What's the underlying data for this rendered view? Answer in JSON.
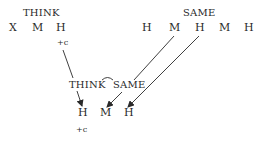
{
  "diagram": {
    "top_left": {
      "gloss": "THINK",
      "segments": [
        "X",
        "M",
        "H"
      ],
      "feature": "+c"
    },
    "top_right": {
      "gloss": "SAME",
      "segments": [
        "H",
        "M",
        "H",
        "M",
        "H"
      ]
    },
    "bottom": {
      "gloss_left": "THINK",
      "gloss_right": "SAME",
      "segments": [
        "H",
        "M",
        "H"
      ],
      "feature": "+c"
    },
    "colors": {
      "ink": "#2a2a2a",
      "background": "#ffffff"
    }
  }
}
